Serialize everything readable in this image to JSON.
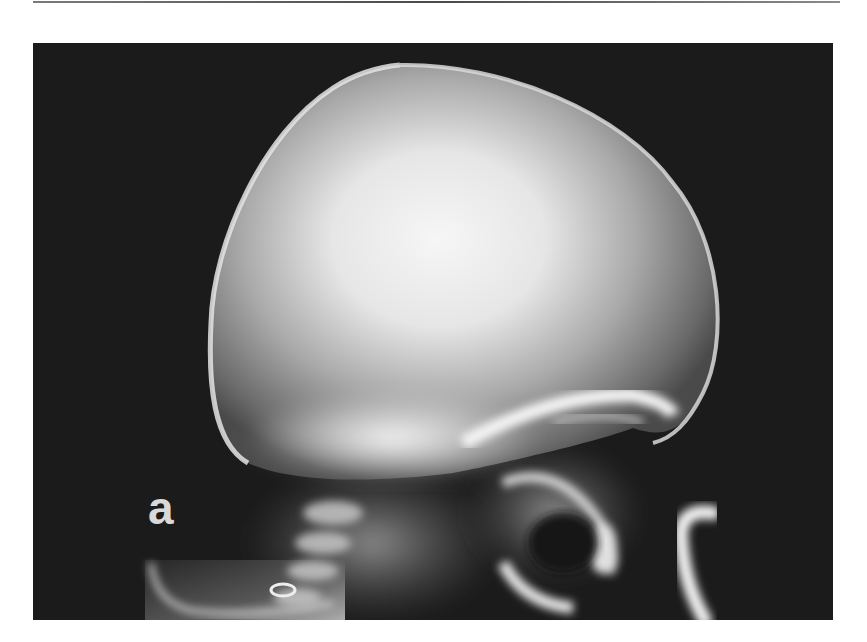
{
  "figure": {
    "panel_label": "a",
    "image_type": "lateral skull radiograph",
    "colors": {
      "background": "#1b1b1b",
      "bone_bright": "#f4f4f4",
      "label": "#d9d9d9",
      "rule": "#5a5a5a"
    }
  }
}
